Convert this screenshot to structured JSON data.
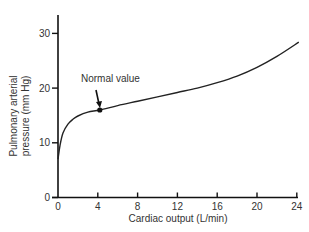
{
  "chart_data": {
    "type": "line",
    "title": "",
    "xlabel": "Cardiac output (L/min)",
    "ylabel_lines": [
      "Pulmonary arterial",
      "pressure (mm Hg)"
    ],
    "ylabel": "Pulmonary arterial pressure (mm Hg)",
    "xlim": [
      0,
      24
    ],
    "ylim": [
      0,
      33
    ],
    "x_ticks": [
      0,
      4,
      8,
      12,
      16,
      20,
      24
    ],
    "y_ticks": [
      0,
      10,
      20,
      30
    ],
    "grid": false,
    "legend": null,
    "series": [
      {
        "name": "Pulmonary arterial pressure",
        "x": [
          0,
          0.2,
          0.5,
          1.0,
          1.5,
          2.0,
          3.0,
          4.2,
          6,
          8,
          10,
          12,
          14,
          16,
          18,
          20,
          22,
          24.2
        ],
        "y": [
          7,
          9.5,
          11.8,
          13.4,
          14.3,
          14.9,
          15.6,
          16.0,
          16.8,
          17.6,
          18.4,
          19.2,
          20.0,
          21.0,
          22.2,
          23.8,
          25.8,
          28.4
        ]
      }
    ],
    "annotations": [
      {
        "text": "Normal value",
        "x": 4.2,
        "y": 16.0,
        "marker": "dot",
        "arrow": true
      }
    ]
  }
}
